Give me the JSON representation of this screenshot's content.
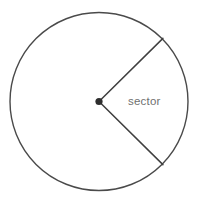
{
  "figure": {
    "name": "circle-sector-diagram",
    "width": 198,
    "height": 203,
    "background_color": "#ffffff"
  },
  "chart_data": {
    "type": "diagram",
    "title": "",
    "subtitle": "",
    "xlabel": "",
    "ylabel": "",
    "shape": "circle-with-sector",
    "circle": {
      "center_x": 99,
      "center_y": 101.5,
      "radius": 89,
      "stroke_color": "#4a4a4a",
      "stroke_width": 1.4,
      "fill": "none"
    },
    "center_point": {
      "x": 99,
      "y": 101.5,
      "radius": 3.6,
      "color": "#2e2e2e"
    },
    "radii": [
      {
        "name": "upper-radius",
        "angle_degrees": 45,
        "x1": 99,
        "y1": 101.5,
        "x2": 162.9,
        "y2": 38.4,
        "stroke_color": "#3f3f3f",
        "stroke_width": 1.5
      },
      {
        "name": "lower-radius",
        "angle_degrees": -45,
        "x1": 99,
        "y1": 101.5,
        "x2": 162.9,
        "y2": 164.6,
        "stroke_color": "#3f3f3f",
        "stroke_width": 1.5
      }
    ],
    "sector": {
      "start_angle_degrees": -45,
      "end_angle_degrees": 45,
      "central_angle_degrees": 90,
      "opening_direction": "right"
    },
    "annotations": [
      {
        "name": "sector-label",
        "text": "sector",
        "x": 128,
        "y": 105,
        "color": "#6f6f6f",
        "font_size": 11.5
      }
    ],
    "grid": false,
    "legend": null
  },
  "labels": {
    "sector": "sector"
  },
  "colors": {
    "circle_stroke": "#4a4a4a",
    "radius_stroke": "#3f3f3f",
    "center_dot": "#2e2e2e",
    "label_text": "#6f6f6f",
    "background": "#ffffff"
  }
}
